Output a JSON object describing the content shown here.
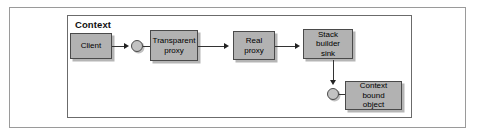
{
  "figure": {
    "type": "block-diagram",
    "title": "Context",
    "outer_frame": true,
    "background_color": "#ffffff",
    "node_fill_color": "#b2b2b2",
    "node_border_color": "#4a4a4a",
    "connector_color": "#333333"
  },
  "container": {
    "label": "Context"
  },
  "nodes": [
    {
      "id": "client",
      "label": "Client"
    },
    {
      "id": "transparent-proxy",
      "label_line1": "Transparent",
      "label_line2": "proxy"
    },
    {
      "id": "real-proxy",
      "label_line1": "Real",
      "label_line2": "proxy"
    },
    {
      "id": "stack-builder-sink",
      "label_line1": "Stack builder",
      "label_line2": "sink"
    },
    {
      "id": "context-bound-object",
      "label_line1": "Context bound",
      "label_line2": "object"
    }
  ],
  "ports": [
    {
      "id": "port-transparent-proxy"
    },
    {
      "id": "port-context-bound-object"
    }
  ],
  "connections": [
    {
      "from": "client",
      "to": "port-transparent-proxy",
      "arrow": "right"
    },
    {
      "from": "port-transparent-proxy",
      "to": "transparent-proxy",
      "arrow": "none"
    },
    {
      "from": "transparent-proxy",
      "to": "real-proxy",
      "arrow": "right"
    },
    {
      "from": "real-proxy",
      "to": "stack-builder-sink",
      "arrow": "right"
    },
    {
      "from": "stack-builder-sink",
      "to": "port-context-bound-object",
      "arrow": "down"
    },
    {
      "from": "port-context-bound-object",
      "to": "context-bound-object",
      "arrow": "none"
    }
  ]
}
